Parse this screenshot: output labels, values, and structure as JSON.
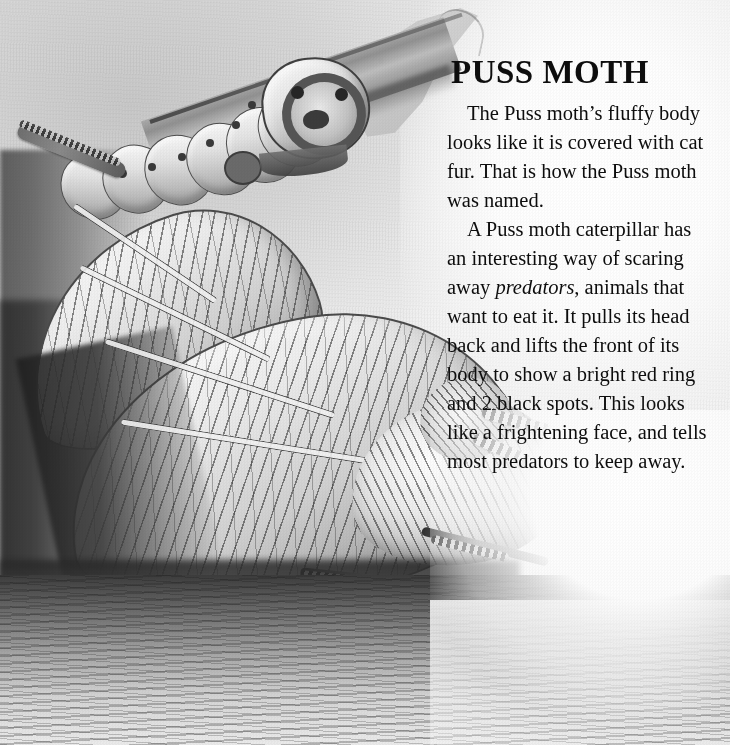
{
  "page": {
    "kind": "illustrated-book-page",
    "width": 730,
    "height": 745,
    "background_color": "#f2f2f2",
    "text_color": "#0d0d0d"
  },
  "article": {
    "title": "PUSS MOTH",
    "paragraphs": [
      "The Puss moth’s fluffy body looks like it is covered with cat fur. That is how the Puss moth was named.",
      "A Puss moth caterpillar has an interesting way of scaring away predators, animals that want to eat it. It pulls its head back and lifts the front of its body to show a bright red ring and 2 black spots. This looks like a frightening face, and tells most predators to keep away."
    ],
    "paragraph_2_parts": {
      "before_italic": "A Puss moth caterpillar has an interesting way of scaring away ",
      "italic_term": "predators",
      "after_italic": ", animals that want to eat it. It pulls its head back and lifts the front of its body to show a bright red ring and 2 black spots. This looks like a frightening face, and tells most predators to keep away."
    }
  },
  "illustration": {
    "caption_none": "",
    "medium": "grayscale watercolor and pencil",
    "subjects": [
      {
        "name": "puss-moth-caterpillar",
        "position": "upper-left",
        "description": "Caterpillar resting on a diagonal branch, head raised showing a dark face ring and two black eye spots"
      },
      {
        "name": "adult-puss-moth",
        "position": "lower-half",
        "description": "Fluffy adult moth with veined wings spread to the left, banded legs and antennae, standing on the ground"
      },
      {
        "name": "leaf",
        "position": "top-center",
        "description": "Pale gray leaf behind the branch"
      },
      {
        "name": "ground",
        "position": "bottom",
        "description": "Dark textured soil with lighter wash toward the right"
      }
    ]
  }
}
